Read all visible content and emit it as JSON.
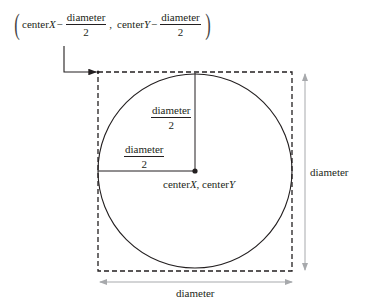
{
  "formula": {
    "term1_var": "centerX",
    "term1_prefix": "center",
    "term1_italic": "X",
    "minus": "−",
    "fraction_num": "diameter",
    "fraction_den": "2",
    "separator": ",",
    "term2_prefix": "center",
    "term2_italic": "Y",
    "open_paren": "(",
    "close_paren": ")"
  },
  "labels": {
    "vertical_radius_num": "diameter",
    "vertical_radius_den": "2",
    "horizontal_radius_num": "diameter",
    "horizontal_radius_den": "2",
    "center_prefix_x": "center",
    "center_italic_x": "X",
    "center_sep": ",",
    "center_prefix_y": "center",
    "center_italic_y": "Y",
    "right_dimension": "diameter",
    "bottom_dimension": "diameter"
  },
  "colors": {
    "stroke": "#231f20",
    "dimension_arrow": "#a7a9ac"
  }
}
